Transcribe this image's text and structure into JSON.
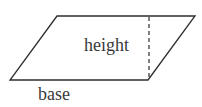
{
  "diagram": {
    "type": "parallelogram",
    "labels": {
      "height": "height",
      "base": "base"
    },
    "vertices": {
      "top_left": [
        57,
        16
      ],
      "top_right": [
        195,
        16
      ],
      "bottom_right": [
        148,
        80
      ],
      "bottom_left": [
        10,
        80
      ]
    },
    "height_line": {
      "x": 149,
      "y1": 17,
      "y2": 80,
      "style": "dashed"
    },
    "colors": {
      "stroke": "#2e2e2e",
      "text": "#3a3a3a",
      "background": "#ffffff"
    }
  }
}
